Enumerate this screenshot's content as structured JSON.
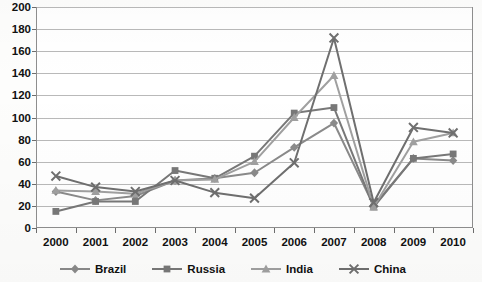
{
  "chart_data": {
    "type": "line",
    "title": "",
    "xlabel": "",
    "ylabel": "",
    "categories": [
      "2000",
      "2001",
      "2002",
      "2003",
      "2004",
      "2005",
      "2006",
      "2007",
      "2008",
      "2009",
      "2010"
    ],
    "ylim": [
      0,
      200
    ],
    "ytick_step": 20,
    "yticks": [
      "0",
      "20",
      "40",
      "60",
      "80",
      "100",
      "120",
      "140",
      "160",
      "180",
      "200"
    ],
    "grid": true,
    "legend_position": "bottom",
    "series": [
      {
        "name": "Brazil",
        "marker": "diamond",
        "color": "#8a8a8a",
        "values": [
          33,
          25,
          29,
          43,
          45,
          50,
          73,
          95,
          20,
          63,
          61
        ]
      },
      {
        "name": "Russia",
        "marker": "square",
        "color": "#787878",
        "values": [
          15,
          24,
          24,
          52,
          45,
          65,
          104,
          109,
          19,
          63,
          67
        ]
      },
      {
        "name": "India",
        "marker": "triangle",
        "color": "#a0a0a0",
        "values": [
          34,
          33,
          31,
          43,
          44,
          60,
          100,
          138,
          19,
          78,
          86
        ]
      },
      {
        "name": "China",
        "marker": "cross",
        "color": "#6f6f6f",
        "values": [
          47,
          37,
          33,
          43,
          32,
          27,
          59,
          172,
          23,
          91,
          86
        ]
      }
    ]
  },
  "legend": {
    "items": [
      {
        "label": "Brazil"
      },
      {
        "label": "Russia"
      },
      {
        "label": "India"
      },
      {
        "label": "China"
      }
    ]
  }
}
